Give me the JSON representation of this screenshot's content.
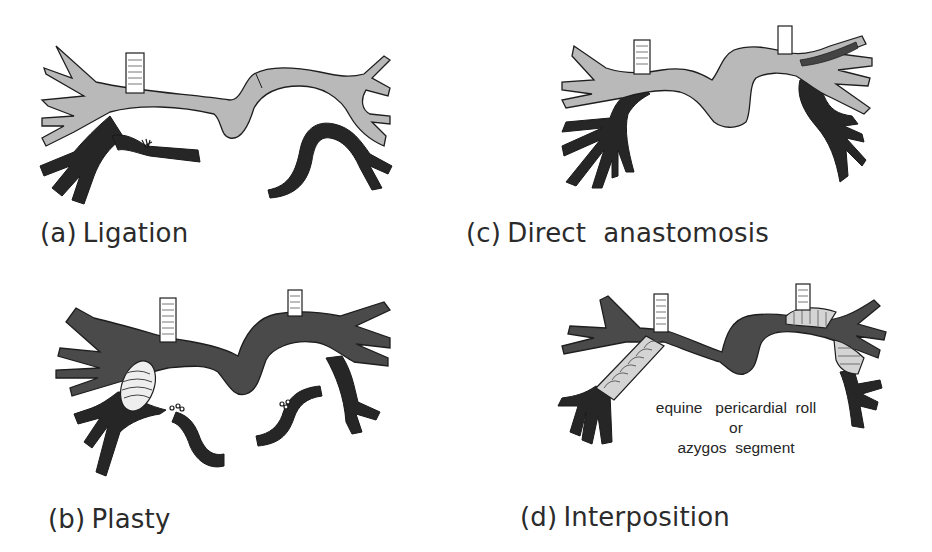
{
  "figure": {
    "panels": [
      {
        "id": "a",
        "tag": "(a)",
        "title": "Ligation"
      },
      {
        "id": "b",
        "tag": "(b)",
        "title": "Plasty"
      },
      {
        "id": "c",
        "tag": "(c)",
        "title": "Direct  anastomosis"
      },
      {
        "id": "d",
        "tag": "(d)",
        "title": "Interposition",
        "annotation": {
          "line1": "equine   pericardial  roll",
          "line2": "or",
          "line3": "azygos  segment"
        }
      }
    ]
  },
  "colors": {
    "artery_light": "#b9b9b9",
    "artery_dark": "#4a4a4a",
    "vein": "#262626",
    "graft": "#d4d4d4",
    "outline": "#1e1e1e",
    "background": "#ffffff"
  }
}
